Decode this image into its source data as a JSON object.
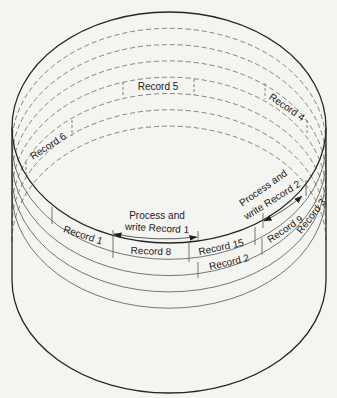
{
  "diagram": {
    "type": "helical-scan drum with record tracks",
    "colors": {
      "background": "#f4f4f0",
      "outline": "#262626",
      "track": "#555555"
    },
    "back_tracks_dashed": 7,
    "front_tracks_solid": 4,
    "labels": {
      "record_1": "Record 1",
      "record_2": "Record 2",
      "record_3": "Record 3",
      "record_4": "Record 4",
      "record_5": "Record 5",
      "record_6": "Record 6",
      "record_8": "Record 8",
      "record_9": "Record 9",
      "record_15": "Record 15"
    },
    "annotations": {
      "process_record_1": {
        "line1": "Process and",
        "line2": "write Record 1"
      },
      "process_record_2": {
        "line1": "Process and",
        "line2": "write Record 2"
      }
    }
  }
}
